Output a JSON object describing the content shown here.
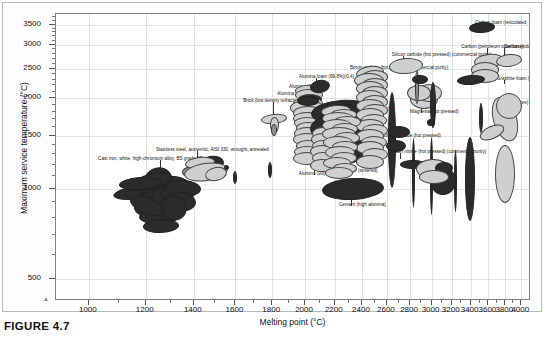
{
  "figure": {
    "caption": "FIGURE 4.7",
    "corner_mark": "▲"
  },
  "chart_data": {
    "type": "scatter",
    "title": "",
    "xlabel": "Melting point (°C)",
    "ylabel": "Maximum service temperature (°C)",
    "xscale": "log",
    "yscale": "log",
    "xlim": [
      900,
      4100
    ],
    "ylim": [
      430,
      3800
    ],
    "grid": true,
    "legend": "none",
    "xticks": [
      1000,
      1200,
      1400,
      1600,
      1800,
      2000,
      2200,
      2400,
      2600,
      2800,
      3000,
      3200,
      3400,
      3600,
      3800,
      4000
    ],
    "xticklabels": [
      "1000",
      "1200",
      "1400",
      "1600",
      "1800",
      "2000",
      "2200",
      "2400",
      "2600",
      "2800",
      "3000",
      "3200",
      "3400",
      "3600",
      "3800",
      "4000"
    ],
    "yticks": [
      500,
      1000,
      1500,
      2000,
      2500,
      3000,
      3500
    ],
    "yticklabels": [
      "500",
      "1000",
      "1500",
      "2000",
      "2500",
      "3000",
      "3500"
    ],
    "annotations": [
      {
        "label": "Carbon foam (reticulated, vitreous)(0.05)",
        "x": 3500,
        "y": 3480,
        "label_x": 3450,
        "label_y": 3560
      },
      {
        "label": "Carbon (petroleum coke base)",
        "x": 3600,
        "y": 2660,
        "label_x": 3300,
        "label_y": 2950
      },
      {
        "label": "Carbon (industrial)",
        "x": 3800,
        "y": 2680,
        "label_x": 3780,
        "label_y": 2960
      },
      {
        "label": "Graphite foam (0.12)",
        "x": 3800,
        "y": 2230,
        "label_x": 3700,
        "label_y": 2320
      },
      {
        "label": "Graphite (pure)",
        "x": 3820,
        "y": 1750,
        "label_x": 3700,
        "label_y": 1920
      },
      {
        "label": "Silicon carbide (hot pressed) (commercial purity)",
        "x": 2750,
        "y": 2560,
        "label_x": 2640,
        "label_y": 2780
      },
      {
        "label": "Boron carbide (hot pressed) (commercial purity)",
        "x": 2450,
        "y": 2420,
        "label_x": 2310,
        "label_y": 2520
      },
      {
        "label": "Alumina foam (99.8%)(0.4)",
        "x": 2080,
        "y": 2190,
        "label_x": 1960,
        "label_y": 2340
      },
      {
        "label": "Alumina (99.7)",
        "x": 2040,
        "y": 2060,
        "label_x": 1900,
        "label_y": 2180
      },
      {
        "label": "Alumina (99.98)",
        "x": 2020,
        "y": 1930,
        "label_x": 1830,
        "label_y": 2060
      },
      {
        "label": "Brick (low density refractory)(1.3)",
        "x": 1810,
        "y": 1700,
        "label_x": 1640,
        "label_y": 1960
      },
      {
        "label": "Concrete (high alumina cement)",
        "x": 2250,
        "y": 1760,
        "label_x": 2120,
        "label_y": 1840
      },
      {
        "label": "Magnesia (hot pressed)",
        "x": 2900,
        "y": 1900,
        "label_x": 2800,
        "label_y": 1800
      },
      {
        "label": "Silicon carbide (hot pressed)",
        "x": 2680,
        "y": 1530,
        "label_x": 2560,
        "label_y": 1500
      },
      {
        "label": "Silicon nitride (hot pressed) (commercial purity)",
        "x": 2720,
        "y": 1250,
        "label_x": 2620,
        "label_y": 1320
      },
      {
        "label": "Silicon nitride (sintered)",
        "x": 2260,
        "y": 1180,
        "label_x": 2160,
        "label_y": 1140
      },
      {
        "label": "Alumina (99)",
        "x": 2060,
        "y": 1230,
        "label_x": 1960,
        "label_y": 1120
      },
      {
        "label": "Cement (high alumina)",
        "x": 2320,
        "y": 1000,
        "label_x": 2230,
        "label_y": 880
      },
      {
        "label": "Stainless steel, austenitic, AISI 330, wrought, annealed",
        "x": 1420,
        "y": 1240,
        "label_x": 1240,
        "label_y": 1340
      },
      {
        "label": "Cast iron, white, high-chromium alloy, BS grade 3E",
        "x": 1260,
        "y": 1060,
        "label_x": 1030,
        "label_y": 1250
      }
    ],
    "bubble_clusters": [
      {
        "name": "carbon-foam-vitreous",
        "tone": "dark"
      },
      {
        "name": "carbon-petroleum-coke",
        "tone": "light"
      },
      {
        "name": "carbon-industrial",
        "tone": "light"
      },
      {
        "name": "graphite-foam",
        "tone": "dark"
      },
      {
        "name": "graphite-pure",
        "tone": "light"
      },
      {
        "name": "silicon-carbide-hot-pressed",
        "tone": "light"
      },
      {
        "name": "boron-carbide-hot-pressed",
        "tone": "light"
      },
      {
        "name": "alumina-foam",
        "tone": "dark"
      },
      {
        "name": "alumina-997",
        "tone": "light"
      },
      {
        "name": "alumina-9998",
        "tone": "dark"
      },
      {
        "name": "brick-low-density-refractory",
        "tone": "light"
      },
      {
        "name": "concrete-high-alumina-cement",
        "tone": "dark"
      },
      {
        "name": "magnesia-hot-pressed",
        "tone": "light"
      },
      {
        "name": "silicon-nitride-hot-pressed",
        "tone": "dark"
      },
      {
        "name": "silicon-nitride-sintered",
        "tone": "light"
      },
      {
        "name": "alumina-99",
        "tone": "light"
      },
      {
        "name": "cement-high-alumina",
        "tone": "dark"
      },
      {
        "name": "stainless-steel-aisi-330",
        "tone": "light"
      },
      {
        "name": "cast-iron-white-high-chromium",
        "tone": "dark"
      }
    ],
    "colors": {
      "bubble_dark": "#2b2b2b",
      "bubble_light": "#cfcfcf",
      "bubble_mid": "#8f8f8f",
      "bubble_stroke": "#3a3a3a",
      "grid": "#e2e2e2",
      "frame": "#808080",
      "text": "#111111"
    }
  }
}
